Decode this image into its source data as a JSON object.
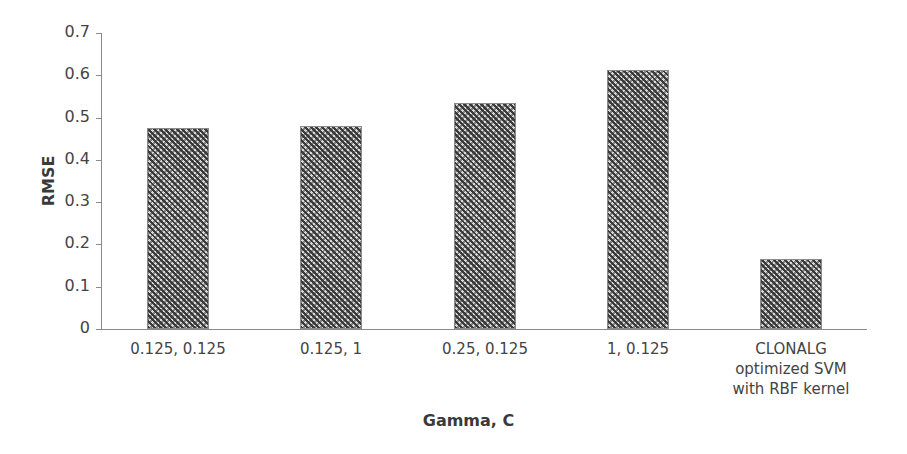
{
  "chart_data": {
    "type": "bar",
    "title": "",
    "xlabel": "Gamma, C",
    "ylabel": "RMSE",
    "categories": [
      "0.125, 0.125",
      "0.125, 1",
      "0.25, 0.125",
      "1, 0.125",
      "CLONALG optimized SVM with RBF kernel"
    ],
    "category_lines": [
      [
        "0.125, 0.125"
      ],
      [
        "0.125, 1"
      ],
      [
        "0.25, 0.125"
      ],
      [
        "1, 0.125"
      ],
      [
        "CLONALG",
        "optimized SVM",
        "with RBF kernel"
      ]
    ],
    "values": [
      0.475,
      0.48,
      0.534,
      0.612,
      0.165
    ],
    "ylim": [
      0,
      0.7
    ],
    "yticks": [
      "0",
      "0.1",
      "0.2",
      "0.3",
      "0.4",
      "0.5",
      "0.6",
      "0.7"
    ],
    "grid": false,
    "legend": null,
    "bar_fill": "crosshatch dark gray"
  }
}
